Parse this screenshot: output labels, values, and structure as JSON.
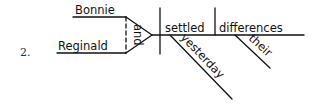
{
  "problem_number": "2.",
  "diagram": {
    "compound_subject": [
      "Bonnie",
      "Reginald"
    ],
    "conjunction": "and",
    "verb": "settled",
    "direct_object": "differences",
    "verb_modifier": "yesterday",
    "object_modifier": "their"
  }
}
